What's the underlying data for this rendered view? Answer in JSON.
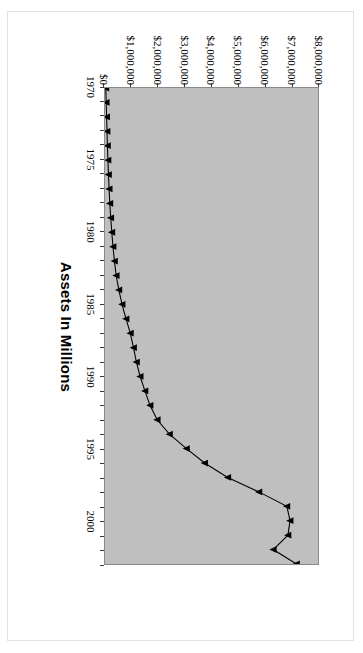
{
  "chart_data": {
    "type": "line",
    "title": "",
    "subtitle": "",
    "orientation": "rotated-90",
    "xlabel": "",
    "ylabel": "Assets In Millions",
    "value_axis_title": "Assets In Millions",
    "grid": false,
    "legend": "none",
    "marker": "triangle",
    "line_color": "#000000",
    "plot_background": "#bfbfbf",
    "xlim": [
      1970,
      2003
    ],
    "ylim": [
      0,
      8000000
    ],
    "ytick_labels": [
      "$8,000,000",
      "$7,000,000",
      "$6,000,000",
      "$5,000,000",
      "$4,000,000",
      "$3,000,000",
      "$2,000,000",
      "$1,000,000",
      "$0"
    ],
    "ytick_values": [
      8000000,
      7000000,
      6000000,
      5000000,
      4000000,
      3000000,
      2000000,
      1000000,
      0
    ],
    "xtick_labels": [
      "1970",
      "1975",
      "1980",
      "1985",
      "1990",
      "1995",
      "2000"
    ],
    "xtick_values": [
      1970,
      1975,
      1980,
      1985,
      1990,
      1995,
      2000
    ],
    "categories": [
      1970,
      1971,
      1972,
      1973,
      1974,
      1975,
      1976,
      1977,
      1978,
      1979,
      1980,
      1981,
      1982,
      1983,
      1984,
      1985,
      1986,
      1987,
      1988,
      1989,
      1990,
      1991,
      1992,
      1993,
      1994,
      1995,
      1996,
      1997,
      1998,
      1999,
      2000,
      2001,
      2002,
      2003
    ],
    "values": [
      30000,
      45000,
      60000,
      75000,
      90000,
      110000,
      130000,
      155000,
      180000,
      215000,
      255000,
      300000,
      355000,
      420000,
      520000,
      640000,
      790000,
      950000,
      1070000,
      1180000,
      1320000,
      1500000,
      1690000,
      1960000,
      2420000,
      3060000,
      3740000,
      4610000,
      5780000,
      6830000,
      6950000,
      6870000,
      6320000,
      7190000
    ],
    "series": [
      {
        "name": "Assets",
        "values": [
          30000,
          45000,
          60000,
          75000,
          90000,
          110000,
          130000,
          155000,
          180000,
          215000,
          255000,
          300000,
          355000,
          420000,
          520000,
          640000,
          790000,
          950000,
          1070000,
          1180000,
          1320000,
          1500000,
          1690000,
          1960000,
          2420000,
          3060000,
          3740000,
          4610000,
          5780000,
          6830000,
          6950000,
          6870000,
          6320000,
          7190000
        ]
      }
    ]
  }
}
